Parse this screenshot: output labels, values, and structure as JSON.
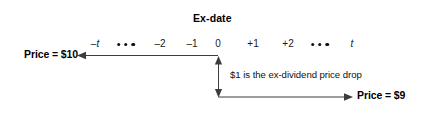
{
  "diagram": {
    "title": "Ex-date",
    "price_before_label": "Price = $10",
    "price_after_label": "Price = $9",
    "drop_caption": "$1 is the ex-dividend price drop",
    "timeline": {
      "ticks": [
        {
          "label": "–t",
          "italic": true,
          "x": 95
        },
        {
          "label": "–2",
          "italic": false,
          "x": 160
        },
        {
          "label": "–1",
          "italic": false,
          "x": 192
        },
        {
          "label": "0",
          "italic": false,
          "x": 218
        },
        {
          "label": "+1",
          "italic": false,
          "x": 253
        },
        {
          "label": "+2",
          "italic": false,
          "x": 288
        },
        {
          "label": "t",
          "italic": true,
          "x": 352
        }
      ],
      "ellipses": [
        {
          "x": 126
        },
        {
          "x": 320
        }
      ],
      "ex_date_x": 218
    },
    "colors": {
      "line": "#3d3d3d",
      "text": "#000000",
      "background": "#ffffff"
    }
  }
}
